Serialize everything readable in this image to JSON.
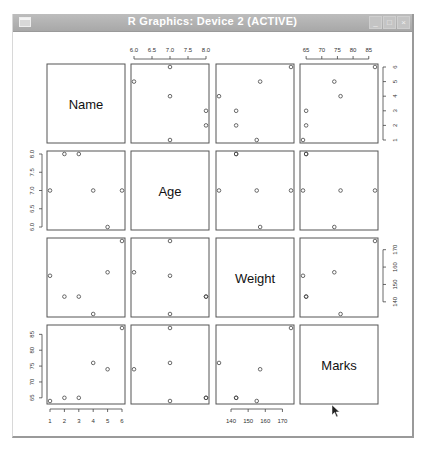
{
  "window": {
    "title": "R Graphics: Device 2 (ACTIVE)",
    "buttons": [
      "minimize",
      "maximize",
      "close"
    ]
  },
  "chart_data": {
    "type": "scatter",
    "subtype": "scatterplot-matrix",
    "title": "",
    "variables": [
      "Name",
      "Age",
      "Weight",
      "Marks"
    ],
    "data": {
      "Name": [
        1,
        2,
        3,
        4,
        5,
        6
      ],
      "Age": [
        7.0,
        8.0,
        8.0,
        7.0,
        6.0,
        7.0
      ],
      "Weight": [
        155,
        143,
        143,
        133,
        157,
        175
      ],
      "Marks": [
        64,
        65,
        65,
        76,
        74,
        87
      ]
    },
    "axes": {
      "Name": {
        "ticks": [
          1,
          2,
          3,
          4,
          5,
          6
        ],
        "range": [
          1,
          6
        ],
        "tick_labels": [
          "1",
          "2",
          "3",
          "4",
          "5",
          "6"
        ]
      },
      "Age": {
        "ticks": [
          6.0,
          6.5,
          7.0,
          7.5,
          8.0
        ],
        "range": [
          6.0,
          8.0
        ],
        "tick_labels": [
          "6.0",
          "6.5",
          "7.0",
          "7.5",
          "8.0"
        ]
      },
      "Weight": {
        "ticks": [
          140,
          150,
          160,
          170
        ],
        "range": [
          133,
          175
        ],
        "tick_labels": [
          "140",
          "150",
          "160",
          "170"
        ]
      },
      "Marks": {
        "ticks": [
          65,
          70,
          75,
          80,
          85
        ],
        "range": [
          64,
          87
        ],
        "tick_labels": [
          "65",
          "70",
          "75",
          "80",
          "85"
        ]
      }
    },
    "axis_placement": {
      "top": [
        "Age",
        "Marks"
      ],
      "bottom": [
        "Name",
        "Weight"
      ],
      "left": [
        "Age",
        "Marks"
      ],
      "right": [
        "Name",
        "Weight"
      ]
    },
    "grid": false,
    "legend": null
  }
}
